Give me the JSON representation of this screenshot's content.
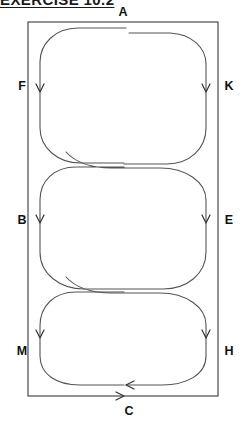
{
  "page": {
    "title_partial": "EXERCISE 10.2",
    "background_color": "#ffffff",
    "width": 250,
    "height": 427
  },
  "figure": {
    "name": "three-stacked-loops-in-rectangle",
    "stroke_color": "#555555",
    "border_color": "#3a3a3a",
    "border": {
      "x": 28,
      "y": 22,
      "width": 190,
      "height": 374
    },
    "loops": [
      {
        "id": "top-loop",
        "cx": 123,
        "top": 28,
        "bottom": 163,
        "left": 40,
        "right": 206
      },
      {
        "id": "middle-loop",
        "cx": 123,
        "top": 158,
        "bottom": 288,
        "left": 40,
        "right": 206
      },
      {
        "id": "bottom-loop",
        "cx": 123,
        "top": 283,
        "bottom": 390,
        "left": 40,
        "right": 206
      }
    ],
    "labels": [
      {
        "id": "A",
        "text": "A",
        "x": 123,
        "y": 16,
        "anchor": "middle",
        "position": "top-center"
      },
      {
        "id": "F",
        "text": "F",
        "x": 22,
        "y": 86,
        "anchor": "middle",
        "position": "left-upper"
      },
      {
        "id": "K",
        "text": "K",
        "x": 229,
        "y": 86,
        "anchor": "middle",
        "position": "right-upper"
      },
      {
        "id": "B",
        "text": "B",
        "x": 22,
        "y": 220,
        "anchor": "middle",
        "position": "left-middle"
      },
      {
        "id": "E",
        "text": "E",
        "x": 229,
        "y": 220,
        "anchor": "middle",
        "position": "right-middle"
      },
      {
        "id": "M",
        "text": "M",
        "x": 22,
        "y": 352,
        "anchor": "middle",
        "position": "left-lower"
      },
      {
        "id": "H",
        "text": "H",
        "x": 229,
        "y": 352,
        "anchor": "middle",
        "position": "right-lower"
      },
      {
        "id": "C",
        "text": "C",
        "x": 129,
        "y": 415,
        "anchor": "middle",
        "position": "bottom-center"
      }
    ],
    "arrows": [
      {
        "id": "arrow-F",
        "at_label": "F",
        "x": 40,
        "y": 90,
        "direction": "down"
      },
      {
        "id": "arrow-K",
        "at_label": "K",
        "x": 206,
        "y": 90,
        "direction": "down"
      },
      {
        "id": "arrow-B",
        "at_label": "B",
        "x": 40,
        "y": 221,
        "direction": "down"
      },
      {
        "id": "arrow-E",
        "at_label": "E",
        "x": 206,
        "y": 221,
        "direction": "down"
      },
      {
        "id": "arrow-M",
        "at_label": "M",
        "x": 40,
        "y": 336,
        "direction": "down"
      },
      {
        "id": "arrow-H",
        "at_label": "H",
        "x": 206,
        "y": 336,
        "direction": "down"
      },
      {
        "id": "arrow-C-curve",
        "at_label": "C",
        "x": 128,
        "y": 384,
        "direction": "left"
      },
      {
        "id": "arrow-C-base",
        "at_label": "C",
        "x": 124,
        "y": 396,
        "direction": "right"
      }
    ]
  }
}
